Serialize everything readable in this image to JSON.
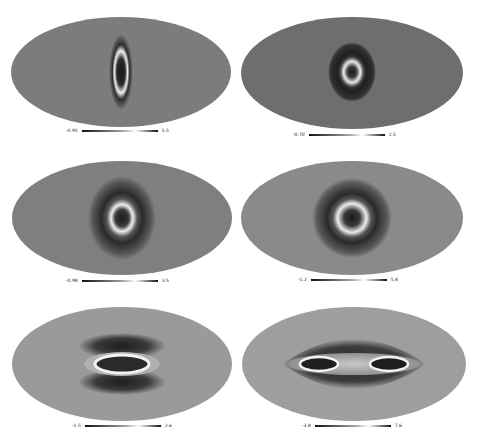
{
  "figure": {
    "background": "#ffffff",
    "panels": [
      {
        "id": "p1",
        "row": 1,
        "col": 1,
        "colorbar": {
          "min": "-0.95",
          "max": "5.5"
        },
        "feature": "narrow vertical ring",
        "map_gray": "#7c7c7c"
      },
      {
        "id": "p2",
        "row": 1,
        "col": 2,
        "colorbar": {
          "min": "-0.70",
          "max": "2.5"
        },
        "feature": "small round ring with dark halo",
        "map_gray": "#6e6e6e"
      },
      {
        "id": "p3",
        "row": 2,
        "col": 1,
        "colorbar": {
          "min": "-0.98",
          "max": "3.5"
        },
        "feature": "ring with dark lobes above and below",
        "map_gray": "#7f7f7f"
      },
      {
        "id": "p4",
        "row": 2,
        "col": 2,
        "colorbar": {
          "min": "-1.2",
          "max": "5.8"
        },
        "feature": "horizontal oval ring with dark halo",
        "map_gray": "#8a8a8a"
      },
      {
        "id": "p5",
        "row": 3,
        "col": 1,
        "colorbar": {
          "min": "-1.5",
          "max": "2.6"
        },
        "feature": "elongated horizontal ring between dark arcs",
        "map_gray": "#9a9a9a"
      },
      {
        "id": "p6",
        "row": 3,
        "col": 2,
        "colorbar": {
          "min": "-3.8",
          "max": "7.6"
        },
        "feature": "two split rings in lens-shaped dark region",
        "map_gray": "#9e9e9e"
      }
    ]
  }
}
